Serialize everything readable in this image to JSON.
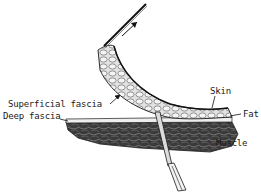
{
  "diagram": {
    "type": "anatomical-illustration",
    "labels": {
      "skin": "Skin",
      "fat": "Fat",
      "superficial_fascia": "Superficial fascia",
      "deep_fascia": "Deep fascia",
      "muscle": "Muscle"
    },
    "elements": [
      {
        "id": "skin-fat-flap",
        "kind": "tissue-layer"
      },
      {
        "id": "deep-fascia",
        "kind": "tissue-layer"
      },
      {
        "id": "muscle-block",
        "kind": "tissue-layer"
      },
      {
        "id": "forceps",
        "kind": "instrument"
      },
      {
        "id": "scalpel-handle",
        "kind": "instrument"
      },
      {
        "id": "direction-arrow",
        "kind": "arrow"
      }
    ],
    "colors": {
      "ink": "#1a1a1a",
      "muscle": "#3a3a3a",
      "fat": "#d8d8d8",
      "background": "#ffffff"
    }
  }
}
